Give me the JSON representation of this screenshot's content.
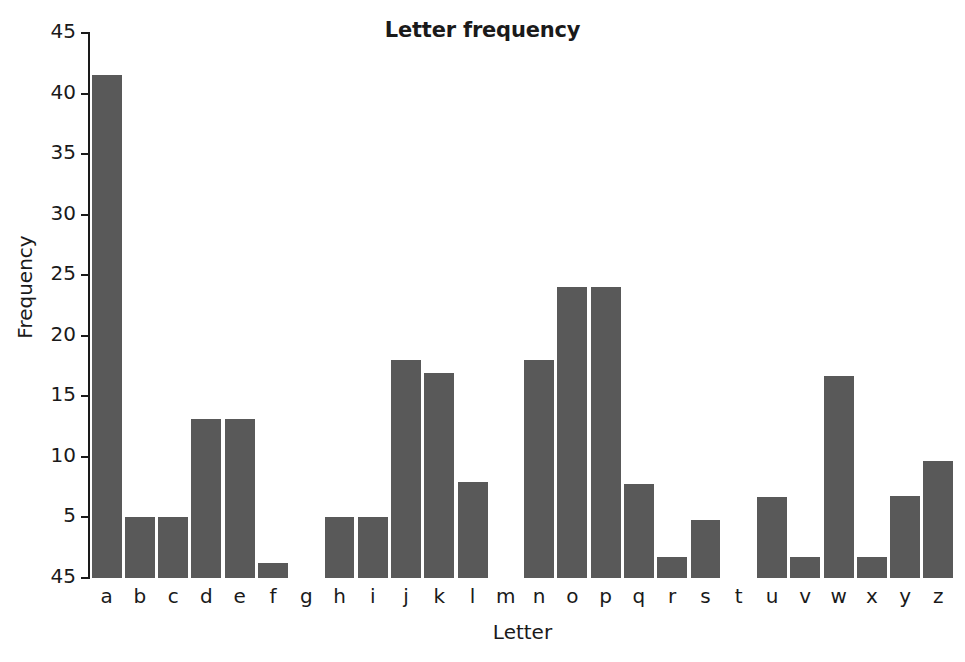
{
  "chart_data": {
    "type": "bar",
    "title": "Letter frequency",
    "xlabel": "Letter",
    "ylabel": "Frequency",
    "categories": [
      "a",
      "b",
      "c",
      "d",
      "e",
      "f",
      "g",
      "h",
      "i",
      "j",
      "k",
      "l",
      "m",
      "n",
      "o",
      "p",
      "q",
      "r",
      "s",
      "t",
      "u",
      "v",
      "w",
      "x",
      "y",
      "z"
    ],
    "values": [
      41.5,
      5.0,
      5.0,
      13.1,
      13.1,
      1.2,
      0,
      5.0,
      5.0,
      18.0,
      16.9,
      7.9,
      0,
      18.0,
      24.0,
      24.0,
      7.8,
      1.7,
      4.8,
      0,
      6.7,
      1.7,
      16.7,
      1.7,
      6.8,
      9.7
    ],
    "ytick_labels": [
      "45",
      "40",
      "35",
      "30",
      "25",
      "20",
      "15",
      "10",
      "5",
      "45"
    ],
    "ytick_values": [
      45,
      40,
      35,
      30,
      25,
      20,
      15,
      10,
      5,
      0
    ],
    "ylim": [
      0,
      45
    ],
    "grid": false,
    "legend": null,
    "bar_color": "#595959",
    "axis_color": "#1a1a1a",
    "background_color": "#ffffff"
  }
}
